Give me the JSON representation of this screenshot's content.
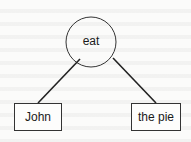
{
  "diagram": {
    "type": "dependency-tree",
    "root": {
      "label": "eat",
      "shape": "circle"
    },
    "children": [
      {
        "label": "John",
        "shape": "rectangle"
      },
      {
        "label": "the pie",
        "shape": "rectangle"
      }
    ],
    "edges": [
      {
        "from": "eat",
        "to": "John"
      },
      {
        "from": "eat",
        "to": "the pie"
      }
    ],
    "colors": {
      "stroke": "#333333",
      "background": "#fbfbfa"
    }
  }
}
